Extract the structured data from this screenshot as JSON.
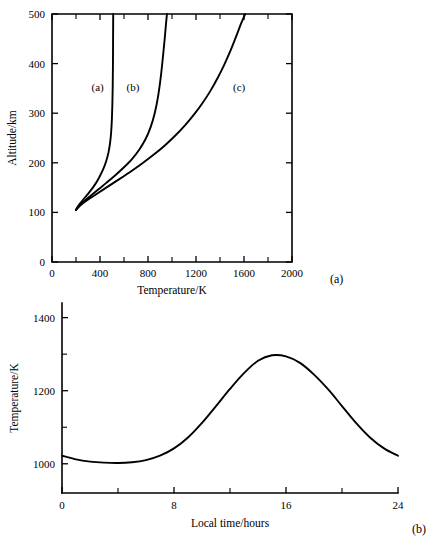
{
  "figure": {
    "panel_a_tag": "(a)",
    "panel_b_tag": "(b)"
  },
  "chart_data": [
    {
      "type": "line",
      "panel": "(a)",
      "title": "",
      "xlabel": "Temperature/K",
      "ylabel": "Altitude/km",
      "xlim": [
        0,
        2000
      ],
      "ylim": [
        0,
        500
      ],
      "xticks": [
        0,
        400,
        800,
        1200,
        1600,
        2000
      ],
      "xtick_labels": [
        "0",
        "400",
        "800",
        "1200",
        "1600",
        "2000"
      ],
      "xticks_minor": [
        200,
        600,
        1000,
        1400,
        1800
      ],
      "yticks": [
        0,
        100,
        200,
        300,
        400,
        500
      ],
      "ytick_labels": [
        "0",
        "100",
        "200",
        "300",
        "400",
        "500"
      ],
      "grid": false,
      "legend": "inline-curve-labels",
      "series": [
        {
          "name": "(a)",
          "label": "(a)",
          "label_x": 380,
          "label_y": 345,
          "exospheric_temperature": 510,
          "points": [
            [
              200,
              105
            ],
            [
              215,
              112
            ],
            [
              240,
              120
            ],
            [
              275,
              130
            ],
            [
              315,
              142
            ],
            [
              355,
              155
            ],
            [
              392,
              170
            ],
            [
              425,
              186
            ],
            [
              450,
              202
            ],
            [
              470,
              220
            ],
            [
              484,
              240
            ],
            [
              493,
              262
            ],
            [
              499,
              288
            ],
            [
              503,
              318
            ],
            [
              506,
              355
            ],
            [
              508,
              400
            ],
            [
              509,
              450
            ],
            [
              510,
              500
            ]
          ]
        },
        {
          "name": "(b)",
          "label": "(b)",
          "label_x": 675,
          "label_y": 345,
          "exospheric_temperature": 960,
          "points": [
            [
              200,
              105
            ],
            [
              225,
              113
            ],
            [
              265,
              122
            ],
            [
              320,
              133
            ],
            [
              385,
              146
            ],
            [
              455,
              160
            ],
            [
              528,
              175
            ],
            [
              600,
              191
            ],
            [
              668,
              208
            ],
            [
              728,
              227
            ],
            [
              780,
              248
            ],
            [
              822,
              272
            ],
            [
              856,
              300
            ],
            [
              884,
              334
            ],
            [
              906,
              372
            ],
            [
              925,
              415
            ],
            [
              941,
              455
            ],
            [
              950,
              480
            ],
            [
              958,
              500
            ]
          ]
        },
        {
          "name": "(c)",
          "label": "(c)",
          "label_x": 1560,
          "label_y": 345,
          "exospheric_temperature": 1870,
          "points": [
            [
              200,
              105
            ],
            [
              235,
              114
            ],
            [
              290,
              124
            ],
            [
              365,
              136
            ],
            [
              452,
              150
            ],
            [
              548,
              165
            ],
            [
              648,
              181
            ],
            [
              748,
              198
            ],
            [
              846,
              216
            ],
            [
              940,
              235
            ],
            [
              1028,
              255
            ],
            [
              1110,
              276
            ],
            [
              1186,
              298
            ],
            [
              1256,
              321
            ],
            [
              1320,
              345
            ],
            [
              1378,
              370
            ],
            [
              1432,
              396
            ],
            [
              1482,
              423
            ],
            [
              1530,
              452
            ],
            [
              1578,
              482
            ],
            [
              1610,
              500
            ]
          ]
        }
      ]
    },
    {
      "type": "line",
      "panel": "(b)",
      "title": "",
      "xlabel": "Local time/hours",
      "ylabel": "Temperature/K",
      "xlim": [
        0,
        24
      ],
      "ylim": [
        920,
        1440
      ],
      "xticks": [
        0,
        8,
        16,
        24
      ],
      "xtick_labels": [
        "0",
        "8",
        "16",
        "24"
      ],
      "xticks_minor": [
        4,
        12,
        20
      ],
      "yticks": [
        1000,
        1200,
        1400
      ],
      "ytick_labels": [
        "1000",
        "1200",
        "1400"
      ],
      "yticks_minor": [
        1100,
        1300
      ],
      "grid": false,
      "series": [
        {
          "name": "diurnal-temperature",
          "points": [
            [
              0,
              1022
            ],
            [
              1,
              1012
            ],
            [
              2,
              1006
            ],
            [
              3,
              1003
            ],
            [
              4,
              1002
            ],
            [
              5,
              1004
            ],
            [
              6,
              1010
            ],
            [
              7,
              1022
            ],
            [
              8,
              1042
            ],
            [
              9,
              1072
            ],
            [
              10,
              1112
            ],
            [
              11,
              1158
            ],
            [
              12,
              1205
            ],
            [
              13,
              1248
            ],
            [
              14,
              1282
            ],
            [
              15,
              1297
            ],
            [
              16,
              1294
            ],
            [
              17,
              1276
            ],
            [
              18,
              1244
            ],
            [
              19,
              1204
            ],
            [
              20,
              1158
            ],
            [
              21,
              1112
            ],
            [
              22,
              1072
            ],
            [
              23,
              1042
            ],
            [
              24,
              1022
            ]
          ]
        }
      ]
    }
  ]
}
